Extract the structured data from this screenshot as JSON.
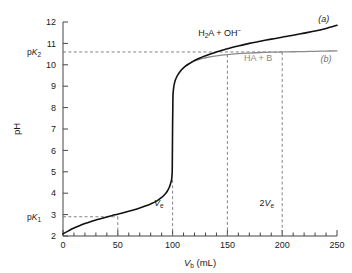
{
  "chart_data": {
    "type": "line",
    "title": "",
    "xlabel": "V_b (mL)",
    "ylabel": "pH",
    "xlim": [
      0,
      250
    ],
    "ylim": [
      2,
      12
    ],
    "grid": false,
    "legend_position": "inline-right",
    "x_ticks": [
      0,
      50,
      100,
      150,
      200,
      250
    ],
    "x_minor_tick_step": 10,
    "y_ticks": [
      2,
      3,
      4,
      5,
      6,
      7,
      8,
      9,
      10,
      11,
      12
    ],
    "series": [
      {
        "name": "(a)",
        "label": "H2A + OH-",
        "color": "#111111",
        "x": [
          0,
          5,
          10,
          15,
          20,
          25,
          30,
          35,
          40,
          45,
          50,
          55,
          60,
          65,
          70,
          75,
          80,
          85,
          90,
          93,
          95,
          97,
          98,
          99,
          99.4,
          99.7,
          100,
          100.3,
          100.6,
          101,
          102,
          103,
          105,
          108,
          112,
          116,
          120,
          125,
          130,
          140,
          150,
          160,
          170,
          180,
          190,
          200,
          210,
          220,
          230,
          240,
          250
        ],
        "y": [
          2.1,
          2.24,
          2.37,
          2.48,
          2.58,
          2.67,
          2.75,
          2.82,
          2.89,
          2.96,
          3.02,
          3.09,
          3.16,
          3.23,
          3.31,
          3.4,
          3.5,
          3.62,
          3.8,
          3.95,
          4.08,
          4.28,
          4.42,
          4.62,
          4.78,
          5.2,
          7.2,
          8.45,
          8.75,
          8.95,
          9.2,
          9.35,
          9.55,
          9.76,
          9.95,
          10.08,
          10.2,
          10.32,
          10.42,
          10.6,
          10.75,
          10.88,
          11.0,
          11.1,
          11.2,
          11.29,
          11.38,
          11.48,
          11.58,
          11.7,
          11.85
        ]
      },
      {
        "name": "(b)",
        "label": "HA + B",
        "color": "#8a8a8a",
        "x": [
          112,
          116,
          120,
          125,
          130,
          140,
          150,
          160,
          170,
          180,
          190,
          200,
          210,
          220,
          230,
          240,
          250
        ],
        "y": [
          9.95,
          10.08,
          10.18,
          10.27,
          10.33,
          10.42,
          10.48,
          10.52,
          10.55,
          10.575,
          10.59,
          10.6,
          10.61,
          10.62,
          10.63,
          10.64,
          10.65
        ]
      }
    ],
    "reference_lines": [
      {
        "name": "pK2-horizontal",
        "axis": "y",
        "value": 10.6,
        "label": "pK2",
        "style": "dashed",
        "color": "#777777"
      },
      {
        "name": "pK1-horizontal",
        "axis": "y",
        "value": 2.9,
        "label": "pK1",
        "style": "dashed",
        "color": "#777777"
      },
      {
        "name": "half-equivalence-vertical",
        "axis": "x",
        "value": 50,
        "label": "",
        "style": "dashed",
        "color": "#777777"
      },
      {
        "name": "equivalence-vertical",
        "axis": "x",
        "value": 100,
        "label": "Ve",
        "style": "dashed",
        "color": "#777777"
      },
      {
        "name": "second-buffer-vertical",
        "axis": "x",
        "value": 150,
        "label": "",
        "style": "dashed",
        "color": "#777777"
      },
      {
        "name": "second-equivalence-vertical",
        "axis": "x",
        "value": 200,
        "label": "2Ve",
        "style": "dashed",
        "color": "#777777"
      }
    ],
    "annotations": [
      {
        "name": "curve-a-species-label",
        "text": "H2A + OH-",
        "x": 143,
        "y": 11.35
      },
      {
        "name": "curve-b-species-label",
        "text": "HA + B",
        "x": 178,
        "y": 10.2
      },
      {
        "name": "curve-a-tag",
        "text": "(a)",
        "x": 240,
        "y": 12.0
      },
      {
        "name": "curve-b-tag",
        "text": "(b)",
        "x": 240,
        "y": 10.2
      },
      {
        "name": "equivalence-label",
        "text": "Ve",
        "x": 100,
        "y": 3.3
      },
      {
        "name": "second-equivalence-label",
        "text": "2Ve",
        "x": 200,
        "y": 3.3
      }
    ]
  },
  "axes": {
    "x_label_main": "V",
    "x_label_sub": "b",
    "x_label_units": " (mL)",
    "y_label": "pH",
    "x_tick_labels": [
      "0",
      "50",
      "100",
      "150",
      "200",
      "250"
    ],
    "y_tick_labels": [
      "2",
      "3",
      "4",
      "5",
      "6",
      "7",
      "8",
      "9",
      "10",
      "11",
      "12"
    ]
  },
  "labels": {
    "pk2_prefix": "p",
    "pk2_k": "K",
    "pk2_sub": "2",
    "pk1_prefix": "p",
    "pk1_k": "K",
    "pk1_sub": "1",
    "species_a_part1": "H",
    "species_a_sub": "2",
    "species_a_part2": "A + OH",
    "species_a_sup": "−",
    "species_b": "HA + B",
    "curve_a_tag": "(a)",
    "curve_b_tag": "(b)",
    "ve_v": "V",
    "ve_sub": "e",
    "two_ve_prefix": "2",
    "two_ve_v": "V",
    "two_ve_sub": "e"
  },
  "colors": {
    "curve_a": "#111111",
    "curve_b": "#8a8a8a",
    "axis": "#444444",
    "dashed": "#777777",
    "background": "#ffffff"
  }
}
